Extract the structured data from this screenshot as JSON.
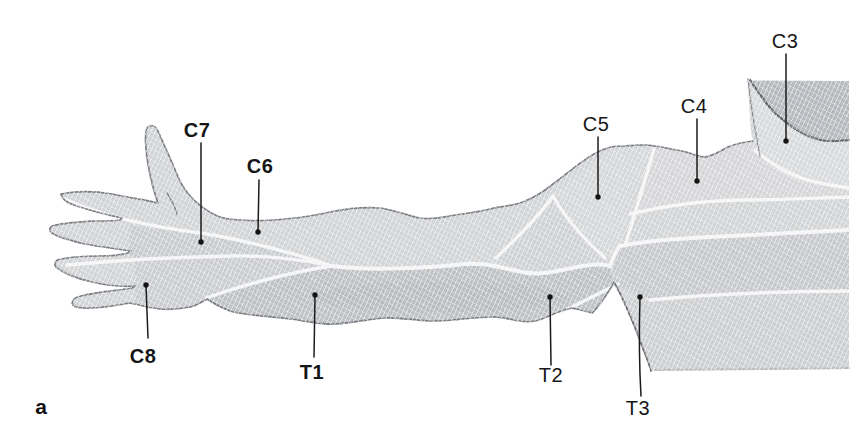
{
  "figure": {
    "panel_letter": "a",
    "labels": [
      {
        "id": "C3",
        "text": "C3",
        "emphasis": false
      },
      {
        "id": "C4",
        "text": "C4",
        "emphasis": false
      },
      {
        "id": "C5",
        "text": "C5",
        "emphasis": false
      },
      {
        "id": "C6",
        "text": "C6",
        "emphasis": true
      },
      {
        "id": "C7",
        "text": "C7",
        "emphasis": true
      },
      {
        "id": "C8",
        "text": "C8",
        "emphasis": true
      },
      {
        "id": "T1",
        "text": "T1",
        "emphasis": true
      },
      {
        "id": "T2",
        "text": "T2",
        "emphasis": false
      },
      {
        "id": "T3",
        "text": "T3",
        "emphasis": false
      }
    ],
    "colors": {
      "background": "#ffffff",
      "skin_base": "#d2d4d6",
      "skin_shade_dark": "#bfc2c5",
      "head_shade": "#b6b9bd",
      "boundary_line": "#f7f7f8",
      "outline": "#7b7d83",
      "label_text": "#161616"
    }
  }
}
